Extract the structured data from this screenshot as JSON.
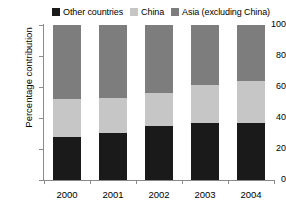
{
  "chart_data": {
    "type": "bar",
    "stacked": true,
    "stacked_mode": "percent",
    "title": "",
    "xlabel": "",
    "ylabel": "Percentage contribution",
    "categories": [
      "2000",
      "2001",
      "2002",
      "2003",
      "2004"
    ],
    "ylim": [
      0,
      100
    ],
    "yticks": [
      0,
      20,
      40,
      60,
      80,
      100
    ],
    "grid": false,
    "legend_position": "top-center",
    "series": [
      {
        "name": "Other countries",
        "color": "#1a1a1a",
        "values": [
          28,
          30,
          35,
          37,
          37
        ]
      },
      {
        "name": "China",
        "color": "#c6c6c6",
        "values": [
          24,
          23,
          21,
          24,
          27
        ]
      },
      {
        "name": "Asia (excluding China)",
        "color": "#7d7d7d",
        "values": [
          48,
          47,
          44,
          39,
          36
        ]
      }
    ]
  },
  "legend": {
    "items": [
      {
        "label": "Other countries",
        "swatch": "#1a1a1a"
      },
      {
        "label": "China",
        "swatch": "#c6c6c6"
      },
      {
        "label": "Asia (excluding China)",
        "swatch": "#7d7d7d"
      }
    ]
  },
  "axes": {
    "y_title": "Percentage contribution",
    "y_tick_labels": [
      "100",
      "80",
      "60",
      "40",
      "20",
      "0"
    ],
    "x_tick_labels": [
      "2000",
      "2001",
      "2002",
      "2003",
      "2004"
    ]
  },
  "colors": {
    "other_countries": "#1a1a1a",
    "china": "#c6c6c6",
    "asia_excluding_china": "#7d7d7d",
    "axis": "#8a8a8a",
    "background": "#ffffff"
  }
}
